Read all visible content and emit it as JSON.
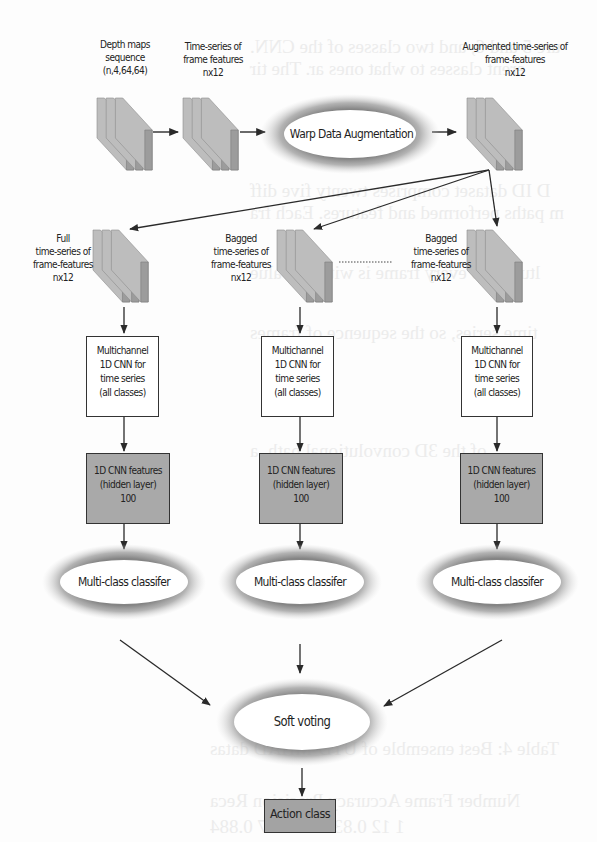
{
  "diagram": {
    "input": {
      "depth_maps_label": [
        "Depth maps",
        "sequence",
        "(n,4,64,64)"
      ],
      "frame_features_label": [
        "Time-series of",
        "frame features",
        "nx12"
      ],
      "augmented_label": [
        "Augmented time-series of",
        "frame-features",
        "nx12"
      ]
    },
    "augmentation": {
      "label": "Warp Data Augmentation"
    },
    "branches": [
      {
        "id": "full",
        "series_label": [
          "Full",
          "time-series of",
          "frame-features",
          "nx12"
        ],
        "cnn_label": [
          "Multichannel",
          "1D CNN for",
          "time series",
          "(all classes)"
        ],
        "features_label": [
          "1D CNN  features",
          "(hidden layer)",
          "100"
        ],
        "classifier_label": "Multi-class classifer"
      },
      {
        "id": "bagged-1",
        "series_label": [
          "Bagged",
          "time-series of",
          "frame-features",
          "nx12"
        ],
        "cnn_label": [
          "Multichannel",
          "1D CNN for",
          "time series",
          "(all classes)"
        ],
        "features_label": [
          "1D CNN  features",
          "(hidden layer)",
          "100"
        ],
        "classifier_label": "Multi-class classifer"
      },
      {
        "id": "bagged-n",
        "series_label": [
          "Bagged",
          "time-series of",
          "frame-features",
          "nx12"
        ],
        "cnn_label": [
          "Multichannel",
          "1D CNN for",
          "time series",
          "(all classes)"
        ],
        "features_label": [
          "1D CNN  features",
          "(hidden layer)",
          "100"
        ],
        "classifier_label": "Multi-class classifer"
      }
    ],
    "ensemble": {
      "label": "Soft voting"
    },
    "output": {
      "label": "Action class"
    },
    "colors": {
      "stack_face": "#b4b4b4",
      "stack_side": "#8c8c8c",
      "feature_box": "#a9a9a9",
      "halo": "#8a8a8a",
      "line": "#2a2a2a"
    }
  },
  "background_bleed": [
    "ure 5 and 6, and two classes of the CNN.",
    "erent classes to what ones ar. The tir",
    "D ID dataset comprises twenty five diff",
    "m paths performed and features. Each fra",
    "ltures, so every frame is with 16 value",
    "time series, so the sequence of frames",
    "of the 3D convolutional path, a",
    "Table 4: Best ensemble of UTD-MHAD datas",
    "Number  Frame   Accuracy  Precision  Reca",
    "1       12      0.8340    0.8237   0.884"
  ]
}
